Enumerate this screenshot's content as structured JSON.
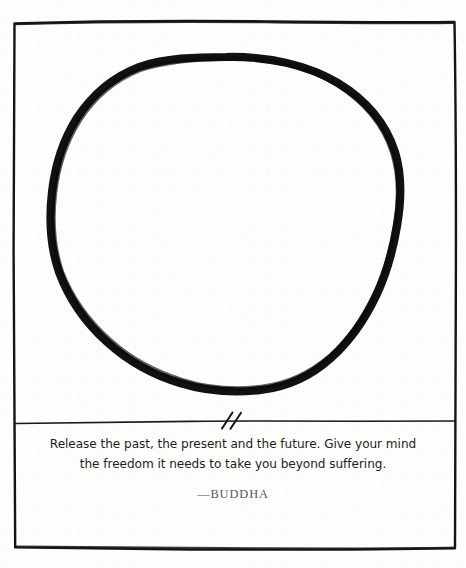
{
  "page": {
    "kind": "zen-enso-quote-card",
    "width": 466,
    "height": 568,
    "background_color": "#fdfdfc",
    "ink_color": "#111111"
  },
  "frame": {
    "name": "hand-drawn-border",
    "stroke_color": "#141414"
  },
  "enso": {
    "name": "enso-circle",
    "description": "hand-drawn brush circle",
    "stroke_color": "#111111",
    "stroke_width": 8
  },
  "divider": {
    "name": "horizontal-rule",
    "stroke_color": "#1a1a1a",
    "break_mark": "double-slash"
  },
  "quote": {
    "lines": [
      "Release the past, the present and the future. Give your mind",
      "the freedom it needs to take you beyond suffering."
    ],
    "attribution": "—BUDDHA",
    "attribution_color": "#575757"
  }
}
